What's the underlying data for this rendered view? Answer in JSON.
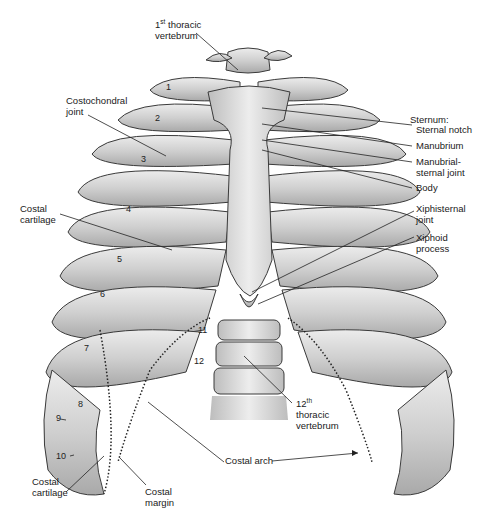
{
  "figure": {
    "labels": {
      "first_thoracic_vertebrum": {
        "prefix": "1",
        "sup": "st",
        "line1": " thoracic",
        "line2": "vertebrum"
      },
      "costochondral_joint": {
        "line1": "Costochondral",
        "line2": "joint"
      },
      "costal_cartilage_upper": {
        "line1": "Costal",
        "line2": "cartilage"
      },
      "sternum_heading": "Sternum:",
      "sternal_notch": "Sternal notch",
      "manubrium": "Manubrium",
      "manubrial_sternal_joint": {
        "line1": "Manubrial-",
        "line2": "sternal joint"
      },
      "body": "Body",
      "xiphisternal_joint": {
        "line1": "Xiphisternal",
        "line2": "joint"
      },
      "xiphoid_process": {
        "line1": "Xiphoid",
        "line2": "process"
      },
      "twelfth_thoracic_vertebrum": {
        "prefix": "12",
        "sup": "th",
        "line1": "thoracic",
        "line2": "vertebrum"
      },
      "costal_arch": "Costal arch",
      "costal_cartilage_lower": {
        "line1": "Costal",
        "line2": "cartilage"
      },
      "costal_margin": {
        "line1": "Costal",
        "line2": "margin"
      }
    },
    "rib_numbers": [
      "1",
      "2",
      "3",
      "4",
      "5",
      "6",
      "7",
      "8",
      "9",
      "10",
      "11",
      "12"
    ],
    "colors": {
      "bone": "#c9c9c9",
      "bone_light": "#e4e4e4",
      "outline": "#3a3a3a",
      "text": "#1a1a1a",
      "background": "#ffffff"
    }
  }
}
